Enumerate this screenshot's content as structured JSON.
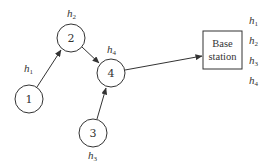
{
  "diagram": {
    "type": "network-topology",
    "nodes": [
      {
        "id": "1",
        "label": "1",
        "cx": 29,
        "cy": 99,
        "r": 14,
        "h_label": {
          "base": "h",
          "sub": "1",
          "x": 24,
          "y": 72
        }
      },
      {
        "id": "2",
        "label": "2",
        "cx": 71,
        "cy": 38,
        "r": 14,
        "h_label": {
          "base": "h",
          "sub": "2",
          "x": 68,
          "y": 18
        }
      },
      {
        "id": "3",
        "label": "3",
        "cx": 93,
        "cy": 133,
        "r": 14,
        "h_label": {
          "base": "h",
          "sub": "3",
          "x": 89,
          "y": 160
        }
      },
      {
        "id": "4",
        "label": "4",
        "cx": 111,
        "cy": 73,
        "r": 14,
        "h_label": {
          "base": "h",
          "sub": "4",
          "x": 108,
          "y": 54
        }
      }
    ],
    "edges": [
      {
        "from": "1",
        "to": "2"
      },
      {
        "from": "2",
        "to": "4"
      },
      {
        "from": "3",
        "to": "4"
      },
      {
        "from": "4",
        "to": "base-station"
      }
    ],
    "base_station": {
      "line1": "Base",
      "line2": "station",
      "x": 203,
      "y": 31,
      "w": 39,
      "h": 38,
      "h_labels": [
        {
          "base": "h",
          "sub": "1"
        },
        {
          "base": "h",
          "sub": "2"
        },
        {
          "base": "h",
          "sub": "3"
        },
        {
          "base": "h",
          "sub": "4"
        }
      ]
    },
    "colors": {
      "stroke": "#333333",
      "background": "#ffffff"
    }
  }
}
